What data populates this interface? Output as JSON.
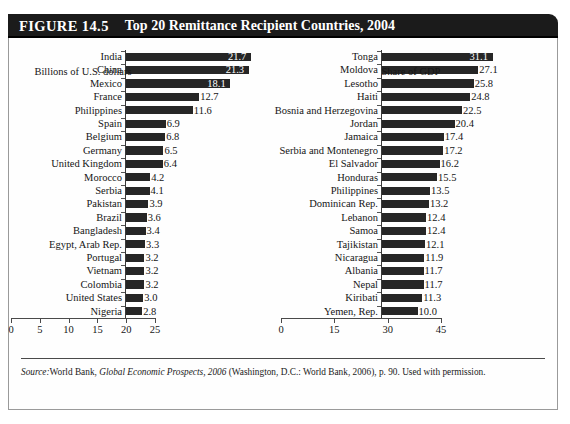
{
  "figure": {
    "number_label": "FIGURE 14.5",
    "title": "Top 20 Remittance Recipient Countries, 2004",
    "source_prefix": "Source:",
    "source_part1": "World Bank,",
    "source_italic": "Global Economic Prospects, 2006",
    "source_part2": "(Washington, D.C.: World Bank, 2006), p. 90. Used with permission."
  },
  "chart_data": [
    {
      "type": "bar",
      "orientation": "horizontal",
      "title": "Top 20 Remittance Recipient Countries, 2004",
      "xlabel": "Billions of U.S. dollars",
      "ylabel": "",
      "xlim": [
        0,
        25
      ],
      "xticks": [
        0,
        5,
        10,
        15,
        20,
        25
      ],
      "grid": false,
      "legend": "none",
      "categories": [
        "India",
        "China",
        "Mexico",
        "France",
        "Philippines",
        "Spain",
        "Belgium",
        "Germany",
        "United Kingdom",
        "Morocco",
        "Serbia",
        "Pakistan",
        "Brazil",
        "Bangladesh",
        "Egypt, Arab Rep.",
        "Portugal",
        "Vietnam",
        "Colombia",
        "United States",
        "Nigeria"
      ],
      "values": [
        21.7,
        21.3,
        18.1,
        12.7,
        11.6,
        6.9,
        6.8,
        6.5,
        6.4,
        4.2,
        4.1,
        3.9,
        3.6,
        3.4,
        3.3,
        3.2,
        3.2,
        3.2,
        3.0,
        2.8
      ],
      "value_labels": [
        "21.7",
        "21.3",
        "18.1",
        "12.7",
        "11.6",
        "6.9",
        "6.8",
        "6.5",
        "6.4",
        "4.2",
        "4.1",
        "3.9",
        "3.6",
        "3.4",
        "3.3",
        "3.2",
        "3.2",
        "3.2",
        "3.0",
        "2.8"
      ],
      "tick_labels": [
        "0",
        "5",
        "10",
        "15",
        "20",
        "25"
      ]
    },
    {
      "type": "bar",
      "orientation": "horizontal",
      "title": "Top 20 Remittance Recipient Countries, 2004",
      "xlabel": "Share of GDP",
      "ylabel": "",
      "xlim": [
        0,
        45
      ],
      "xticks": [
        0,
        15,
        30,
        45
      ],
      "grid": false,
      "legend": "none",
      "categories": [
        "Tonga",
        "Moldova",
        "Lesotho",
        "Haiti",
        "Bosnia and Herzegovina",
        "Jordan",
        "Jamaica",
        "Serbia and Montenegro",
        "El Salvador",
        "Honduras",
        "Philippines",
        "Dominican Rep.",
        "Lebanon",
        "Samoa",
        "Tajikistan",
        "Nicaragua",
        "Albania",
        "Nepal",
        "Kiribati",
        "Yemen, Rep."
      ],
      "values": [
        31.1,
        27.1,
        25.8,
        24.8,
        22.5,
        20.4,
        17.4,
        17.2,
        16.2,
        15.5,
        13.5,
        13.2,
        12.4,
        12.4,
        12.1,
        11.9,
        11.7,
        11.7,
        11.3,
        10.0
      ],
      "value_labels": [
        "31.1",
        "27.1",
        "25.8",
        "24.8",
        "22.5",
        "20.4",
        "17.4",
        "17.2",
        "16.2",
        "15.5",
        "13.5",
        "13.2",
        "12.4",
        "12.4",
        "12.1",
        "11.9",
        "11.7",
        "11.7",
        "11.3",
        "10.0"
      ],
      "tick_labels": [
        "0",
        "15",
        "30",
        "45"
      ]
    }
  ],
  "colors": {
    "bar": "#262626",
    "banner": "#1b1b1b",
    "banner_text": "#ffffff",
    "frame": "#9a9a9a",
    "axis": "#4a4a4a"
  }
}
